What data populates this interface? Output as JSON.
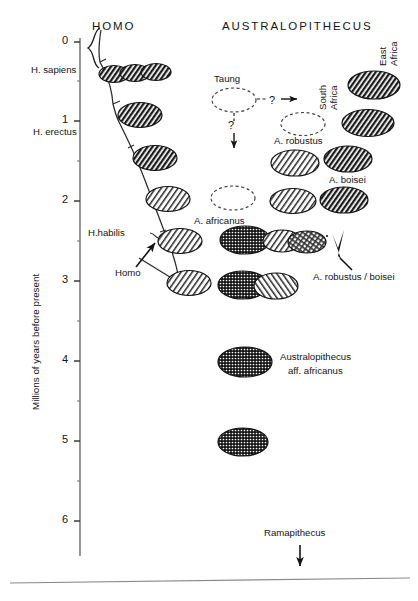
{
  "figure": {
    "headers": {
      "homo": "HOMO",
      "australopithecus": "AUSTRALOPITHECUS"
    },
    "y_axis": {
      "title": "Millions of years before present",
      "unit": "Millions of years",
      "ticks": [
        "0",
        "1",
        "2",
        "3",
        "4",
        "5",
        "6"
      ],
      "tick_values": [
        0,
        1,
        2,
        3,
        4,
        5,
        6
      ],
      "minor_ticks": [
        0.5,
        1.5,
        2.5,
        3.5,
        4.5,
        5.5
      ],
      "range": [
        0,
        6.6
      ]
    },
    "homo_lineage": {
      "labels": [
        {
          "text": "H. sapiens",
          "age": 0.35
        },
        {
          "text": "H. erectus",
          "age": 1.1
        },
        {
          "text": "H.habilis",
          "age": 2.4
        },
        {
          "text": "Homo",
          "age": 2.85
        }
      ],
      "arrow_label": "Homo"
    },
    "australopithecus_labels": {
      "taung": "Taung",
      "south_africa": "South\nAfrica",
      "east_africa": "East\nAfrica",
      "a_robustus": "A. robustus",
      "a_boisei": "A. boisei",
      "a_africanus": "A. africanus",
      "a_robustus_boisei": "A. robustus / boisei",
      "aff_africanus_line1": "Australopithecus",
      "aff_africanus_line2": "aff. africanus",
      "ramapithecus": "Ramapithecus"
    },
    "question_marks": [
      "?",
      "?"
    ],
    "specimens": [
      {
        "name": "H. sapiens group",
        "age": 0.45,
        "fill": "hatch-dark",
        "column": "homo"
      },
      {
        "name": "H. erectus",
        "age": 1.0,
        "fill": "hatch-dark",
        "column": "homo"
      },
      {
        "name": "H. erectus older",
        "age": 1.55,
        "fill": "hatch-dark",
        "column": "homo"
      },
      {
        "name": "Homo 2.0",
        "age": 2.0,
        "fill": "hatch-light",
        "column": "homo"
      },
      {
        "name": "Homo 2.45",
        "age": 2.45,
        "fill": "hatch-light",
        "column": "homo"
      },
      {
        "name": "Homo 2.95",
        "age": 2.95,
        "fill": "hatch-light",
        "column": "homo"
      },
      {
        "name": "Taung",
        "age": 0.85,
        "fill": "dashed-open",
        "column": "taung"
      },
      {
        "name": "Taung descendant",
        "age": 2.1,
        "fill": "dashed-open",
        "column": "taung"
      },
      {
        "name": "A. africanus",
        "age": 2.5,
        "fill": "dots-dark",
        "column": "africanus"
      },
      {
        "name": "A. africanus older",
        "age": 2.95,
        "fill": "dots-dark",
        "column": "africanus"
      },
      {
        "name": "South Africa open",
        "age": 1.15,
        "fill": "dashed-open",
        "column": "south-africa"
      },
      {
        "name": "A. robustus",
        "age": 1.8,
        "fill": "hatch-light",
        "column": "south-africa"
      },
      {
        "name": "A. robustus 2.2",
        "age": 2.2,
        "fill": "hatch-light",
        "column": "south-africa"
      },
      {
        "name": "A. robustus 2.5",
        "age": 2.5,
        "fill": "hatch-light",
        "column": "south-africa"
      },
      {
        "name": "A. boisei 0.75",
        "age": 0.75,
        "fill": "hatch-dark",
        "column": "east-africa"
      },
      {
        "name": "A. boisei 1.25",
        "age": 1.25,
        "fill": "hatch-dark",
        "column": "east-africa"
      },
      {
        "name": "A. boisei 1.8",
        "age": 1.8,
        "fill": "hatch-dark",
        "column": "east-africa"
      },
      {
        "name": "A. boisei 2.2",
        "age": 2.2,
        "fill": "hatch-dark",
        "column": "east-africa"
      },
      {
        "name": "A. boisei 2.5",
        "age": 2.5,
        "fill": "hatch-dark",
        "column": "east-africa"
      },
      {
        "name": "A. boisei 2.95",
        "age": 2.95,
        "fill": "hatch-light",
        "column": "east-africa"
      },
      {
        "name": "Australopithecus aff. africanus 4.0",
        "age": 4.0,
        "fill": "dots-dark",
        "column": "africanus"
      },
      {
        "name": "Australopithecus aff. africanus 5.0",
        "age": 5.0,
        "fill": "dots-dark",
        "column": "africanus"
      }
    ]
  }
}
